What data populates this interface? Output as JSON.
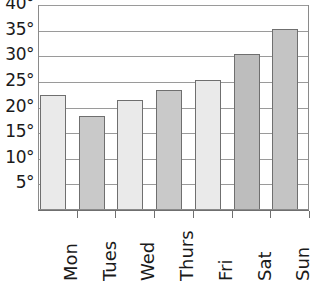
{
  "chart_data": {
    "type": "bar",
    "title": "",
    "subtitle": "",
    "xlabel": "",
    "ylabel": "",
    "categories": [
      "Mon",
      "Tues",
      "Wed",
      "Thurs",
      "Fri",
      "Sat",
      "Sun"
    ],
    "values": [
      22,
      18,
      21,
      23,
      25,
      30,
      35
    ],
    "unit": "°",
    "ylim": [
      0,
      40
    ],
    "ytick_values": [
      5,
      10,
      15,
      20,
      25,
      30,
      35,
      40
    ],
    "ytick_labels": [
      "5°",
      "10°",
      "15°",
      "20°",
      "25°",
      "30°",
      "35°",
      "40°"
    ],
    "grid": true,
    "grid_axis": "y",
    "legend": false,
    "legend_position": "none",
    "bar_colors": [
      "#eaeaea",
      "#c9c9c9",
      "#eaeaea",
      "#c9c9c9",
      "#eaeaea",
      "#bdbdbd",
      "#c4c4c4"
    ],
    "bar_border_color": "#6f6f6f",
    "gridline_color": "#9a9a9a",
    "axis_color": "#6f6f6f",
    "background_color": "#ffffff",
    "text_color": "#1a1a1a",
    "xtick_label_rotation": -90
  }
}
